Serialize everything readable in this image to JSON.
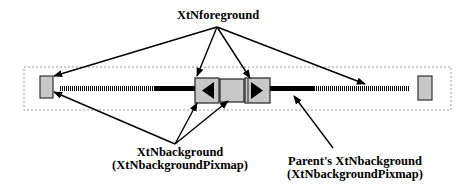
{
  "diagram": {
    "type": "annotated-scrollbar",
    "labels": {
      "foreground": "XtNforeground",
      "background_line1": "XtNbackground",
      "background_line2": "(XtNbackgroundPixmap)",
      "parent_line1": "Parent's XtNbackground",
      "parent_line2": "(XtNbackgroundPixmap)"
    },
    "colors": {
      "widget_fill": "#c8c8c8",
      "stroke": "#000000",
      "frame_dots": "#9a9a9a",
      "background": "#ffffff"
    },
    "components": [
      {
        "name": "left-end-box"
      },
      {
        "name": "left-striped-trough"
      },
      {
        "name": "left-solid-trough"
      },
      {
        "name": "left-arrow-button"
      },
      {
        "name": "thumb"
      },
      {
        "name": "right-arrow-button"
      },
      {
        "name": "right-solid-trough"
      },
      {
        "name": "right-striped-trough"
      },
      {
        "name": "right-end-box"
      }
    ]
  }
}
